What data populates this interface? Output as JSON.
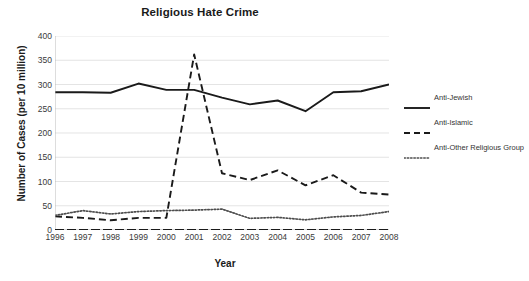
{
  "chart_data": {
    "type": "line",
    "title": "Religious Hate Crime",
    "xlabel": "Year",
    "ylabel": "Number of Cases (per 10 million)",
    "x": [
      1996,
      1997,
      1998,
      1999,
      2000,
      2001,
      2002,
      2003,
      2004,
      2005,
      2006,
      2007,
      2008
    ],
    "xtick_labels": [
      "1996",
      "1997",
      "1998",
      "1999",
      "2000",
      "2001",
      "2002",
      "2003",
      "2004",
      "2005",
      "2006",
      "2007",
      "2008"
    ],
    "ytick_labels": [
      "0",
      "50",
      "100",
      "150",
      "200",
      "250",
      "300",
      "350",
      "400"
    ],
    "yticks": [
      0,
      50,
      100,
      150,
      200,
      250,
      300,
      350,
      400
    ],
    "ylim": [
      0,
      400
    ],
    "xlim": [
      1996,
      2008
    ],
    "grid": "horizontal",
    "legend_position": "right",
    "series": [
      {
        "name": "Anti-Jewish",
        "style": "solid",
        "color": "#1a1a1a",
        "values": [
          284,
          284,
          283,
          302,
          289,
          289,
          273,
          259,
          267,
          245,
          284,
          286,
          300
        ]
      },
      {
        "name": "Anti-Islamic",
        "style": "dashed",
        "color": "#1a1a1a",
        "values": [
          28,
          25,
          20,
          25,
          25,
          362,
          117,
          103,
          123,
          92,
          113,
          77,
          73
        ]
      },
      {
        "name": "Anti-Other Religious Group",
        "style": "dotted",
        "color": "#4d4d4d",
        "values": [
          30,
          40,
          33,
          38,
          40,
          41,
          43,
          24,
          26,
          21,
          27,
          30,
          38
        ]
      }
    ]
  },
  "legend": {
    "items": [
      {
        "label": "Anti-Jewish"
      },
      {
        "label": "Anti-Islamic"
      },
      {
        "label": "Anti-Other Religious Group"
      }
    ]
  }
}
